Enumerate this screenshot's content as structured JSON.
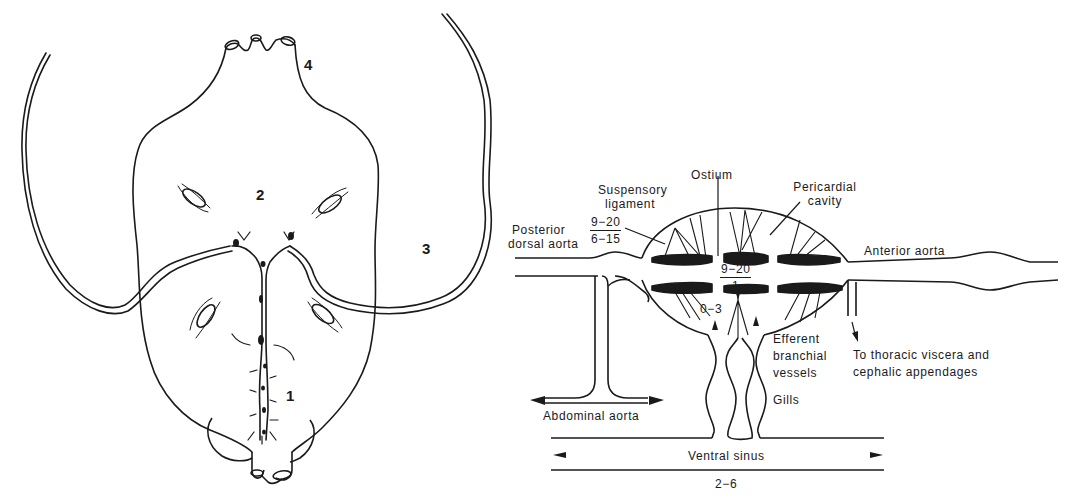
{
  "left_figure": {
    "region_labels": {
      "one": "1",
      "two": "2",
      "three": "3",
      "four": "4"
    }
  },
  "right_figure": {
    "labels": {
      "ostium": "Ostium",
      "suspensory_ligament": [
        "Suspensory",
        "ligament"
      ],
      "pericardial_cavity": [
        "Pericardial",
        "cavity"
      ],
      "posterior_dorsal_aorta": [
        "Posterior",
        "dorsal aorta"
      ],
      "anterior_aorta": "Anterior aorta",
      "efferent_branchial_vessels": [
        "Efferent",
        "branchial",
        "vessels"
      ],
      "gills": "Gills",
      "to_thoracic": [
        "To thoracic viscera and",
        "cephalic appendages"
      ],
      "abdominal_aorta": "Abdominal aorta",
      "ventral_sinus": "Ventral sinus"
    },
    "pressure_values": {
      "posterior_aorta_top": "9−20",
      "posterior_aorta_bottom": "6−15",
      "heart_top": "9−20",
      "heart_bottom": "1",
      "branchial": "0−3",
      "ventral_sinus": "2−6"
    }
  },
  "colors": {
    "ink": "#1a1a1a",
    "background": "#ffffff"
  }
}
